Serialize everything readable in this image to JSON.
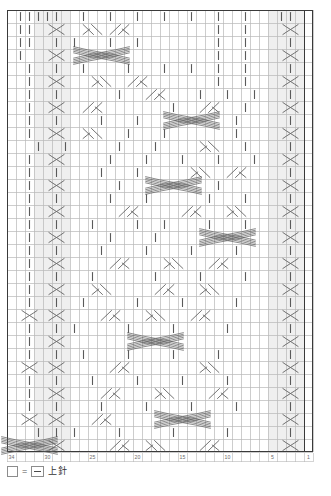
{
  "chart": {
    "kind": "japanese-knitting-symbol-chart",
    "columns": 34,
    "rows": 34,
    "cell_width": 9,
    "cell_height": 13,
    "origin_x": 7,
    "origin_y": 10,
    "grid_color": "#b8b8b8",
    "bold_color": "#3a3a3a",
    "symbol_color": "#5a5a5a",
    "shade_color": "#efefef",
    "reading_direction": "right-to-left",
    "column_ticks": [
      {
        "label": "1",
        "col": 1
      },
      {
        "label": "5",
        "col": 5
      },
      {
        "label": "10",
        "col": 10
      },
      {
        "label": "15",
        "col": 15
      },
      {
        "label": "20",
        "col": 20
      },
      {
        "label": "25",
        "col": 25
      },
      {
        "label": "30",
        "col": 30
      },
      {
        "label": "34",
        "col": 34
      }
    ],
    "bold_columns": [
      1,
      34
    ],
    "bold_rows": [
      34
    ],
    "shaded_columns": [
      2,
      3,
      4,
      5,
      28,
      29,
      30,
      31
    ],
    "symbols": {
      "purl": {
        "name": "purl-stitch",
        "glyph": "dash",
        "legend_label": "上針"
      },
      "cross2": {
        "name": "two-stitch-cross",
        "glyph": "X"
      },
      "right_twist": {
        "name": "right-slant-twist",
        "glyph": "slash-pair"
      },
      "left_twist": {
        "name": "left-slant-twist",
        "glyph": "backslash-pair"
      },
      "wide_cable": {
        "name": "wide-cable-crossing",
        "glyph": "multi-strand"
      }
    },
    "cells": [
      {
        "r": 1,
        "c": 3,
        "t": "purl"
      },
      {
        "r": 1,
        "c": 4,
        "t": "purl"
      },
      {
        "r": 1,
        "c": 8,
        "t": "purl"
      },
      {
        "r": 1,
        "c": 11,
        "t": "purl"
      },
      {
        "r": 1,
        "c": 14,
        "t": "purl"
      },
      {
        "r": 1,
        "c": 17,
        "t": "purl"
      },
      {
        "r": 1,
        "c": 20,
        "t": "purl"
      },
      {
        "r": 1,
        "c": 23,
        "t": "purl"
      },
      {
        "r": 1,
        "c": 26,
        "t": "purl"
      },
      {
        "r": 1,
        "c": 29,
        "t": "purl"
      },
      {
        "r": 1,
        "c": 30,
        "t": "purl"
      },
      {
        "r": 1,
        "c": 31,
        "t": "purl"
      },
      {
        "r": 1,
        "c": 32,
        "t": "purl"
      },
      {
        "r": 1,
        "c": 33,
        "t": "purl"
      },
      {
        "r": 2,
        "c": 3,
        "t": "cross2"
      },
      {
        "r": 2,
        "c": 8,
        "t": "purl"
      },
      {
        "r": 2,
        "c": 11,
        "t": "purl"
      },
      {
        "r": 2,
        "c": 22,
        "t": "right_twist"
      },
      {
        "r": 2,
        "c": 25,
        "t": "left_twist"
      },
      {
        "r": 2,
        "c": 29,
        "t": "cross2"
      },
      {
        "r": 2,
        "c": 32,
        "t": "purl"
      },
      {
        "r": 2,
        "c": 33,
        "t": "purl"
      },
      {
        "r": 3,
        "c": 3,
        "t": "purl"
      },
      {
        "r": 3,
        "c": 8,
        "t": "purl"
      },
      {
        "r": 3,
        "c": 11,
        "t": "purl"
      },
      {
        "r": 3,
        "c": 20,
        "t": "purl"
      },
      {
        "r": 3,
        "c": 23,
        "t": "purl"
      },
      {
        "r": 3,
        "c": 27,
        "t": "purl"
      },
      {
        "r": 3,
        "c": 29,
        "t": "purl"
      },
      {
        "r": 3,
        "c": 32,
        "t": "purl"
      },
      {
        "r": 3,
        "c": 33,
        "t": "purl"
      },
      {
        "r": 4,
        "c": 3,
        "t": "cross2"
      },
      {
        "r": 4,
        "c": 8,
        "t": "purl"
      },
      {
        "r": 4,
        "c": 11,
        "t": "purl"
      },
      {
        "r": 4,
        "c": 24,
        "t": "wide_cable"
      },
      {
        "r": 4,
        "c": 29,
        "t": "cross2"
      },
      {
        "r": 4,
        "c": 33,
        "t": "purl"
      },
      {
        "r": 5,
        "c": 3,
        "t": "purl"
      },
      {
        "r": 5,
        "c": 8,
        "t": "purl"
      },
      {
        "r": 5,
        "c": 11,
        "t": "purl"
      },
      {
        "r": 5,
        "c": 14,
        "t": "purl"
      },
      {
        "r": 5,
        "c": 17,
        "t": "purl"
      },
      {
        "r": 5,
        "c": 21,
        "t": "purl"
      },
      {
        "r": 5,
        "c": 26,
        "t": "purl"
      },
      {
        "r": 5,
        "c": 29,
        "t": "purl"
      },
      {
        "r": 5,
        "c": 32,
        "t": "purl"
      },
      {
        "r": 6,
        "c": 3,
        "t": "cross2"
      },
      {
        "r": 6,
        "c": 8,
        "t": "purl"
      },
      {
        "r": 6,
        "c": 11,
        "t": "purl"
      },
      {
        "r": 6,
        "c": 20,
        "t": "right_twist"
      },
      {
        "r": 6,
        "c": 24,
        "t": "left_twist"
      },
      {
        "r": 6,
        "c": 29,
        "t": "cross2"
      },
      {
        "r": 6,
        "c": 32,
        "t": "purl"
      },
      {
        "r": 7,
        "c": 3,
        "t": "purl"
      },
      {
        "r": 7,
        "c": 7,
        "t": "purl"
      },
      {
        "r": 7,
        "c": 10,
        "t": "purl"
      },
      {
        "r": 7,
        "c": 13,
        "t": "purl"
      },
      {
        "r": 7,
        "c": 18,
        "t": "right_twist"
      },
      {
        "r": 7,
        "c": 22,
        "t": "purl"
      },
      {
        "r": 7,
        "c": 29,
        "t": "purl"
      },
      {
        "r": 7,
        "c": 32,
        "t": "purl"
      },
      {
        "r": 8,
        "c": 3,
        "t": "cross2"
      },
      {
        "r": 8,
        "c": 8,
        "t": "purl"
      },
      {
        "r": 8,
        "c": 12,
        "t": "right_twist"
      },
      {
        "r": 8,
        "c": 16,
        "t": "purl"
      },
      {
        "r": 8,
        "c": 25,
        "t": "right_twist"
      },
      {
        "r": 8,
        "c": 29,
        "t": "cross2"
      },
      {
        "r": 8,
        "c": 32,
        "t": "purl"
      },
      {
        "r": 9,
        "c": 3,
        "t": "purl"
      },
      {
        "r": 9,
        "c": 9,
        "t": "purl"
      },
      {
        "r": 9,
        "c": 14,
        "t": "wide_cable"
      },
      {
        "r": 9,
        "c": 20,
        "t": "purl"
      },
      {
        "r": 9,
        "c": 24,
        "t": "purl"
      },
      {
        "r": 9,
        "c": 29,
        "t": "purl"
      },
      {
        "r": 9,
        "c": 32,
        "t": "purl"
      },
      {
        "r": 10,
        "c": 3,
        "t": "cross2"
      },
      {
        "r": 10,
        "c": 9,
        "t": "purl"
      },
      {
        "r": 10,
        "c": 17,
        "t": "purl"
      },
      {
        "r": 10,
        "c": 21,
        "t": "purl"
      },
      {
        "r": 10,
        "c": 25,
        "t": "left_twist"
      },
      {
        "r": 10,
        "c": 29,
        "t": "cross2"
      },
      {
        "r": 10,
        "c": 32,
        "t": "purl"
      },
      {
        "r": 11,
        "c": 3,
        "t": "purl"
      },
      {
        "r": 11,
        "c": 8,
        "t": "purl"
      },
      {
        "r": 11,
        "c": 12,
        "t": "left_twist"
      },
      {
        "r": 11,
        "c": 18,
        "t": "purl"
      },
      {
        "r": 11,
        "c": 22,
        "t": "purl"
      },
      {
        "r": 11,
        "c": 28,
        "t": "purl"
      },
      {
        "r": 11,
        "c": 31,
        "t": "purl"
      },
      {
        "r": 12,
        "c": 3,
        "t": "cross2"
      },
      {
        "r": 12,
        "c": 7,
        "t": "purl"
      },
      {
        "r": 12,
        "c": 11,
        "t": "purl"
      },
      {
        "r": 12,
        "c": 15,
        "t": "purl"
      },
      {
        "r": 12,
        "c": 19,
        "t": "purl"
      },
      {
        "r": 12,
        "c": 23,
        "t": "purl"
      },
      {
        "r": 12,
        "c": 29,
        "t": "cross2"
      },
      {
        "r": 12,
        "c": 32,
        "t": "purl"
      },
      {
        "r": 13,
        "c": 3,
        "t": "purl"
      },
      {
        "r": 13,
        "c": 9,
        "t": "right_twist"
      },
      {
        "r": 13,
        "c": 13,
        "t": "left_twist"
      },
      {
        "r": 13,
        "c": 20,
        "t": "purl"
      },
      {
        "r": 13,
        "c": 24,
        "t": "purl"
      },
      {
        "r": 13,
        "c": 29,
        "t": "purl"
      },
      {
        "r": 13,
        "c": 32,
        "t": "purl"
      },
      {
        "r": 14,
        "c": 3,
        "t": "cross2"
      },
      {
        "r": 14,
        "c": 11,
        "t": "purl"
      },
      {
        "r": 14,
        "c": 16,
        "t": "wide_cable"
      },
      {
        "r": 14,
        "c": 22,
        "t": "purl"
      },
      {
        "r": 14,
        "c": 29,
        "t": "cross2"
      },
      {
        "r": 14,
        "c": 32,
        "t": "purl"
      },
      {
        "r": 15,
        "c": 3,
        "t": "purl"
      },
      {
        "r": 15,
        "c": 8,
        "t": "purl"
      },
      {
        "r": 15,
        "c": 12,
        "t": "purl"
      },
      {
        "r": 15,
        "c": 19,
        "t": "purl"
      },
      {
        "r": 15,
        "c": 23,
        "t": "purl"
      },
      {
        "r": 15,
        "c": 29,
        "t": "purl"
      },
      {
        "r": 15,
        "c": 32,
        "t": "purl"
      },
      {
        "r": 16,
        "c": 3,
        "t": "cross2"
      },
      {
        "r": 16,
        "c": 9,
        "t": "left_twist"
      },
      {
        "r": 16,
        "c": 14,
        "t": "right_twist"
      },
      {
        "r": 16,
        "c": 21,
        "t": "right_twist"
      },
      {
        "r": 16,
        "c": 29,
        "t": "cross2"
      },
      {
        "r": 16,
        "c": 32,
        "t": "purl"
      },
      {
        "r": 17,
        "c": 3,
        "t": "purl"
      },
      {
        "r": 17,
        "c": 8,
        "t": "purl"
      },
      {
        "r": 17,
        "c": 12,
        "t": "purl"
      },
      {
        "r": 17,
        "c": 17,
        "t": "purl"
      },
      {
        "r": 17,
        "c": 20,
        "t": "purl"
      },
      {
        "r": 17,
        "c": 25,
        "t": "purl"
      },
      {
        "r": 17,
        "c": 29,
        "t": "purl"
      },
      {
        "r": 17,
        "c": 32,
        "t": "purl"
      },
      {
        "r": 18,
        "c": 3,
        "t": "cross2"
      },
      {
        "r": 18,
        "c": 10,
        "t": "wide_cable"
      },
      {
        "r": 18,
        "c": 18,
        "t": "purl"
      },
      {
        "r": 18,
        "c": 23,
        "t": "purl"
      },
      {
        "r": 18,
        "c": 29,
        "t": "cross2"
      },
      {
        "r": 18,
        "c": 32,
        "t": "purl"
      },
      {
        "r": 19,
        "c": 3,
        "t": "purl"
      },
      {
        "r": 19,
        "c": 9,
        "t": "purl"
      },
      {
        "r": 19,
        "c": 14,
        "t": "purl"
      },
      {
        "r": 19,
        "c": 19,
        "t": "purl"
      },
      {
        "r": 19,
        "c": 24,
        "t": "purl"
      },
      {
        "r": 19,
        "c": 29,
        "t": "purl"
      },
      {
        "r": 19,
        "c": 32,
        "t": "purl"
      },
      {
        "r": 20,
        "c": 3,
        "t": "cross2"
      },
      {
        "r": 20,
        "c": 11,
        "t": "right_twist"
      },
      {
        "r": 20,
        "c": 16,
        "t": "left_twist"
      },
      {
        "r": 20,
        "c": 22,
        "t": "right_twist"
      },
      {
        "r": 20,
        "c": 29,
        "t": "cross2"
      },
      {
        "r": 20,
        "c": 32,
        "t": "purl"
      },
      {
        "r": 21,
        "c": 3,
        "t": "purl"
      },
      {
        "r": 21,
        "c": 8,
        "t": "purl"
      },
      {
        "r": 21,
        "c": 13,
        "t": "purl"
      },
      {
        "r": 21,
        "c": 18,
        "t": "purl"
      },
      {
        "r": 21,
        "c": 25,
        "t": "purl"
      },
      {
        "r": 21,
        "c": 29,
        "t": "purl"
      },
      {
        "r": 21,
        "c": 32,
        "t": "purl"
      },
      {
        "r": 22,
        "c": 3,
        "t": "cross2"
      },
      {
        "r": 22,
        "c": 12,
        "t": "left_twist"
      },
      {
        "r": 22,
        "c": 17,
        "t": "right_twist"
      },
      {
        "r": 22,
        "c": 24,
        "t": "left_twist"
      },
      {
        "r": 22,
        "c": 29,
        "t": "cross2"
      },
      {
        "r": 22,
        "c": 32,
        "t": "purl"
      },
      {
        "r": 23,
        "c": 3,
        "t": "purl"
      },
      {
        "r": 23,
        "c": 9,
        "t": "purl"
      },
      {
        "r": 23,
        "c": 15,
        "t": "purl"
      },
      {
        "r": 23,
        "c": 20,
        "t": "purl"
      },
      {
        "r": 23,
        "c": 26,
        "t": "purl"
      },
      {
        "r": 23,
        "c": 29,
        "t": "purl"
      },
      {
        "r": 23,
        "c": 32,
        "t": "purl"
      },
      {
        "r": 24,
        "c": 3,
        "t": "cross2"
      },
      {
        "r": 24,
        "c": 13,
        "t": "right_twist"
      },
      {
        "r": 24,
        "c": 18,
        "t": "left_twist"
      },
      {
        "r": 24,
        "c": 23,
        "t": "right_twist"
      },
      {
        "r": 24,
        "c": 29,
        "t": "cross2"
      },
      {
        "r": 24,
        "c": 32,
        "t": "cross2"
      },
      {
        "r": 25,
        "c": 3,
        "t": "purl"
      },
      {
        "r": 25,
        "c": 10,
        "t": "purl"
      },
      {
        "r": 25,
        "c": 16,
        "t": "purl"
      },
      {
        "r": 25,
        "c": 21,
        "t": "purl"
      },
      {
        "r": 25,
        "c": 27,
        "t": "purl"
      },
      {
        "r": 25,
        "c": 29,
        "t": "purl"
      },
      {
        "r": 25,
        "c": 32,
        "t": "purl"
      },
      {
        "r": 26,
        "c": 3,
        "t": "cross2"
      },
      {
        "r": 26,
        "c": 18,
        "t": "wide_cable"
      },
      {
        "r": 26,
        "c": 29,
        "t": "cross2"
      },
      {
        "r": 26,
        "c": 32,
        "t": "purl"
      },
      {
        "r": 27,
        "c": 3,
        "t": "purl"
      },
      {
        "r": 27,
        "c": 11,
        "t": "purl"
      },
      {
        "r": 27,
        "c": 16,
        "t": "purl"
      },
      {
        "r": 27,
        "c": 21,
        "t": "purl"
      },
      {
        "r": 27,
        "c": 26,
        "t": "purl"
      },
      {
        "r": 27,
        "c": 29,
        "t": "purl"
      },
      {
        "r": 27,
        "c": 32,
        "t": "purl"
      },
      {
        "r": 28,
        "c": 3,
        "t": "cross2"
      },
      {
        "r": 28,
        "c": 12,
        "t": "left_twist"
      },
      {
        "r": 28,
        "c": 22,
        "t": "right_twist"
      },
      {
        "r": 28,
        "c": 29,
        "t": "cross2"
      },
      {
        "r": 28,
        "c": 32,
        "t": "cross2"
      },
      {
        "r": 29,
        "c": 3,
        "t": "purl"
      },
      {
        "r": 29,
        "c": 10,
        "t": "purl"
      },
      {
        "r": 29,
        "c": 15,
        "t": "purl"
      },
      {
        "r": 29,
        "c": 20,
        "t": "purl"
      },
      {
        "r": 29,
        "c": 25,
        "t": "purl"
      },
      {
        "r": 29,
        "c": 29,
        "t": "purl"
      },
      {
        "r": 29,
        "c": 32,
        "t": "purl"
      },
      {
        "r": 30,
        "c": 3,
        "t": "cross2"
      },
      {
        "r": 30,
        "c": 11,
        "t": "right_twist"
      },
      {
        "r": 30,
        "c": 17,
        "t": "left_twist"
      },
      {
        "r": 30,
        "c": 23,
        "t": "right_twist"
      },
      {
        "r": 30,
        "c": 29,
        "t": "cross2"
      },
      {
        "r": 30,
        "c": 32,
        "t": "purl"
      },
      {
        "r": 31,
        "c": 3,
        "t": "purl"
      },
      {
        "r": 31,
        "c": 9,
        "t": "purl"
      },
      {
        "r": 31,
        "c": 14,
        "t": "purl"
      },
      {
        "r": 31,
        "c": 19,
        "t": "purl"
      },
      {
        "r": 31,
        "c": 24,
        "t": "purl"
      },
      {
        "r": 31,
        "c": 29,
        "t": "purl"
      },
      {
        "r": 31,
        "c": 32,
        "t": "purl"
      },
      {
        "r": 32,
        "c": 3,
        "t": "cross2"
      },
      {
        "r": 32,
        "c": 15,
        "t": "wide_cable"
      },
      {
        "r": 32,
        "c": 24,
        "t": "right_twist"
      },
      {
        "r": 32,
        "c": 29,
        "t": "cross2"
      },
      {
        "r": 32,
        "c": 32,
        "t": "cross2"
      },
      {
        "r": 33,
        "c": 3,
        "t": "purl"
      },
      {
        "r": 33,
        "c": 10,
        "t": "purl"
      },
      {
        "r": 33,
        "c": 16,
        "t": "purl"
      },
      {
        "r": 33,
        "c": 22,
        "t": "purl"
      },
      {
        "r": 33,
        "c": 27,
        "t": "purl"
      },
      {
        "r": 33,
        "c": 29,
        "t": "purl"
      },
      {
        "r": 33,
        "c": 31,
        "t": "purl"
      },
      {
        "r": 34,
        "c": 3,
        "t": "cross2"
      },
      {
        "r": 34,
        "c": 12,
        "t": "right_twist"
      },
      {
        "r": 34,
        "c": 18,
        "t": "left_twist"
      },
      {
        "r": 34,
        "c": 22,
        "t": "right_twist"
      },
      {
        "r": 34,
        "c": 29,
        "t": "cross2"
      },
      {
        "r": 34,
        "c": 32,
        "t": "wide_cable"
      }
    ]
  },
  "legend": {
    "equals": "=",
    "label": "上針",
    "swatch_name": "empty-cell-swatch",
    "symbol_name": "purl-symbol-swatch"
  }
}
